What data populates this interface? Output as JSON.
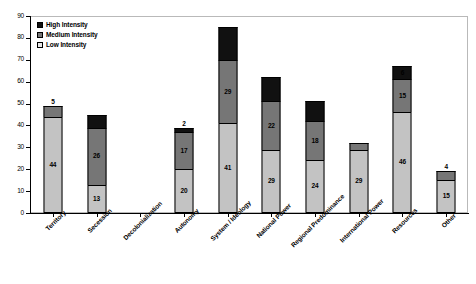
{
  "chart_data": {
    "type": "bar",
    "subtype": "stacked-column",
    "title": "",
    "xlabel": "",
    "ylabel": "",
    "ylim": [
      0,
      90
    ],
    "ytick_step": 10,
    "yticks": [
      90,
      80,
      70,
      60,
      50,
      40,
      30,
      20,
      10,
      0
    ],
    "grid": false,
    "legend_position": "top-left",
    "categories": [
      "Territory",
      "Secession",
      "Decolonialization",
      "Autonomy",
      "System / Ideology",
      "National Power",
      "Regional Predominance",
      "International Power",
      "Resources",
      "Other"
    ],
    "series": [
      {
        "name": "Low Intensity",
        "color": "#c3c3c3",
        "values": [
          44,
          13,
          0,
          20,
          41,
          29,
          24,
          29,
          46,
          15
        ]
      },
      {
        "name": "Medium Intensity",
        "color": "#767676",
        "values": [
          5,
          26,
          0,
          17,
          29,
          22,
          18,
          3,
          15,
          4
        ]
      },
      {
        "name": "High Intensity",
        "color": "#111111",
        "values": [
          0,
          6,
          0,
          2,
          15,
          11,
          9,
          0,
          6,
          0
        ]
      }
    ],
    "totals": [
      49,
      45,
      0,
      39,
      85,
      62,
      51,
      32,
      67,
      19
    ],
    "data_labels": [
      {
        "category": "Territory",
        "low": "44",
        "medium": "5",
        "high": ""
      },
      {
        "category": "Secession",
        "low": "13",
        "medium": "26",
        "high": ""
      },
      {
        "category": "Decolonialization",
        "low": "",
        "medium": "",
        "high": ""
      },
      {
        "category": "Autonomy",
        "low": "20",
        "medium": "17",
        "high": "2"
      },
      {
        "category": "System / Ideology",
        "low": "41",
        "medium": "29",
        "high": ""
      },
      {
        "category": "National Power",
        "low": "29",
        "medium": "22",
        "high": ""
      },
      {
        "category": "Regional Predominance",
        "low": "24",
        "medium": "18",
        "high": ""
      },
      {
        "category": "International Power",
        "low": "29",
        "medium": "",
        "high": "3"
      },
      {
        "category": "Resources",
        "low": "46",
        "medium": "15",
        "high": "6"
      },
      {
        "category": "Other",
        "low": "15",
        "medium": "4",
        "high": ""
      }
    ]
  },
  "legend": {
    "items": [
      {
        "label": "High Intensity",
        "color": "#111111"
      },
      {
        "label": "Medium Intensity",
        "color": "#767676"
      },
      {
        "label": "Low Intensity",
        "color": "#e8e8e8"
      }
    ]
  }
}
